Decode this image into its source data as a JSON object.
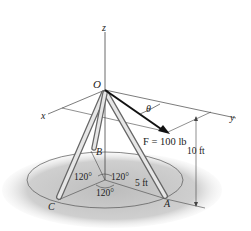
{
  "diagram": {
    "axes": {
      "z": "z",
      "x": "x",
      "y": "y"
    },
    "points": {
      "origin": "O",
      "a": "A",
      "b": "B",
      "c": "C"
    },
    "force": {
      "label": "F = 100 lb",
      "angle_label": "θ"
    },
    "dimensions": {
      "height": "10 ft",
      "radius": "5 ft"
    },
    "angles": {
      "ab": "120°",
      "bc": "120°",
      "ca": "120°"
    },
    "colors": {
      "shadow": "#c8c8c8",
      "leg": "#d8d8d8",
      "line": "#333333",
      "force": "#111111"
    }
  }
}
